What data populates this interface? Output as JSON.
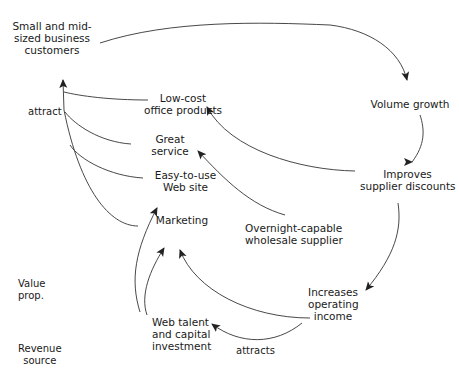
{
  "nodes": {
    "customers": [
      "Small and mid-",
      "sized business",
      "customers"
    ],
    "low_cost": [
      "Low-cost",
      "office products"
    ],
    "service": [
      "Great",
      "service"
    ],
    "website": [
      "Easy-to-use",
      "Web site"
    ],
    "marketing": [
      "Marketing"
    ],
    "supplier": [
      "Overnight-capable",
      "wholesale supplier"
    ],
    "volume": [
      "Volume growth"
    ],
    "discounts": [
      "Improves",
      "supplier discounts"
    ],
    "income": [
      "Increases",
      "operating",
      "income"
    ],
    "web_talent": [
      "Web talent",
      "and capital",
      "investment"
    ]
  },
  "edge_labels": {
    "attract": "attract",
    "attracts": "attracts"
  },
  "side_labels": {
    "value_prop": [
      "Value",
      "prop."
    ],
    "revenue_source": [
      "Revenue",
      "source"
    ]
  },
  "colors": {
    "line": "#333333",
    "text": "#1a1a1a"
  }
}
